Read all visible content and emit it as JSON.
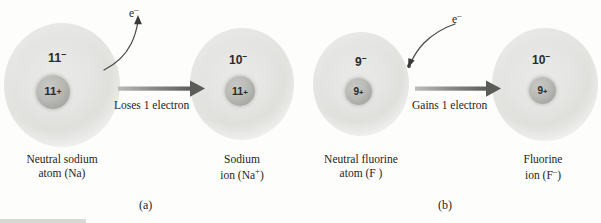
{
  "figure": {
    "panels": [
      {
        "letter": "(a)",
        "process_label": "Loses 1 electron",
        "electron_symbol": "e",
        "electron_charge": "–",
        "left": {
          "electron_count": "11",
          "electron_charge": "–",
          "nucleus_count": "11",
          "nucleus_charge": "+",
          "caption_line1": "Neutral sodium",
          "caption_line2": "atom (Na)"
        },
        "right": {
          "electron_count": "10",
          "electron_charge": "–",
          "nucleus_count": "11",
          "nucleus_charge": "+",
          "caption_line1": "Sodium",
          "caption_line2": "ion (Na",
          "caption_sup": "+",
          "caption_line2_end": ")"
        }
      },
      {
        "letter": "(b)",
        "process_label": "Gains 1 electron",
        "electron_symbol": "e",
        "electron_charge": "–",
        "left": {
          "electron_count": "9",
          "electron_charge": "–",
          "nucleus_count": "9",
          "nucleus_charge": "+",
          "caption_line1": "Neutral fluorine",
          "caption_line2": "atom (F )"
        },
        "right": {
          "electron_count": "10",
          "electron_charge": "–",
          "nucleus_count": "9",
          "nucleus_charge": "+",
          "caption_line1": "Fluorine",
          "caption_line2": "ion (F",
          "caption_sup": "–",
          "caption_line2_end": ")"
        }
      }
    ],
    "colors": {
      "cloud": "#ebebe9",
      "nucleus": "#b9b9b5",
      "arrow": "#6e6e6a",
      "text": "#1d1d1d"
    }
  }
}
